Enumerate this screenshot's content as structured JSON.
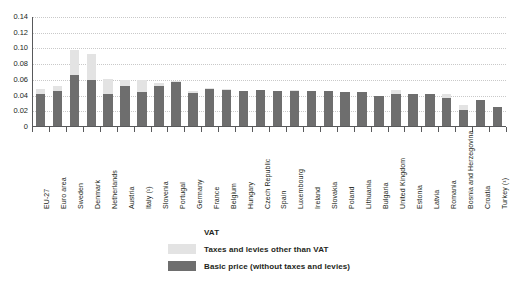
{
  "chart_data": {
    "type": "bar",
    "subtype": "stacked-bar",
    "title": "",
    "xlabel": "",
    "ylabel": "",
    "ylim": [
      0,
      0.14
    ],
    "yticks": [
      "0",
      "0.02",
      "0.04",
      "0.06",
      "0.08",
      "0.10",
      "0.12",
      "0.14"
    ],
    "ytick_values": [
      0,
      0.02,
      0.04,
      0.06,
      0.08,
      0.1,
      0.12,
      0.14
    ],
    "grid": true,
    "legend_position": "bottom",
    "categories": [
      "EU-27",
      "Euro area",
      "Sweden",
      "Denmark",
      "Netherlands",
      "Austria",
      "Italy (¹)",
      "Slovenia",
      "Portugal",
      "Germany",
      "France",
      "Belgium",
      "Hungary",
      "Czech Republic",
      "Spain",
      "Luxembourg",
      "Ireland",
      "Slovakia",
      "Poland",
      "Lithuania",
      "Bulgaria",
      "United Kingdom",
      "Estonia",
      "Latvia",
      "Romania",
      "Bosnia and Herzegovina",
      "Croatia",
      "Turkey (¹)"
    ],
    "series": [
      {
        "name": "Basic price (without taxes and levies)",
        "color": "#6e6e6e",
        "values": [
          0.0425,
          0.0455,
          0.0665,
          0.06,
          0.0415,
          0.052,
          0.045,
          0.0525,
          0.0575,
          0.0435,
          0.049,
          0.0475,
          0.0455,
          0.0465,
          0.046,
          0.0455,
          0.0455,
          0.0455,
          0.045,
          0.044,
          0.0395,
          0.042,
          0.0425,
          0.042,
          0.0375,
          0.0215,
          0.035,
          0.0255
        ]
      },
      {
        "name": "Taxes and levies other than VAT",
        "color": "#e3e3e3",
        "values": [
          0.0055,
          0.007,
          0.032,
          0.033,
          0.019,
          0.008,
          0.0145,
          0.004,
          0.001,
          0.002,
          0.001,
          0.0005,
          0.0005,
          0.0,
          0.0,
          0.001,
          0.0,
          0.0,
          0.0,
          0.0,
          0.0,
          0.005,
          0.0,
          0.0,
          0.004,
          0.0065,
          0.0,
          0.0
        ]
      },
      {
        "name": "VAT",
        "color": "#f4f4f4",
        "values": [
          0.0,
          0.0,
          0.0,
          0.0,
          0.0,
          0.0,
          0.0,
          0.0,
          0.0,
          0.0,
          0.0,
          0.0,
          0.0,
          0.0,
          0.0,
          0.0,
          0.0,
          0.0,
          0.0,
          0.0,
          0.0,
          0.0,
          0.0,
          0.0,
          0.0,
          0.0,
          0.0,
          0.0
        ]
      }
    ],
    "legend": [
      {
        "label": "VAT",
        "swatch": "white"
      },
      {
        "label": "Taxes and levies other than VAT",
        "swatch": "light-gray"
      },
      {
        "label": "Basic price (without taxes and levies)",
        "swatch": "dark-gray"
      }
    ],
    "colors": {
      "basic_price": "#6e6e6e",
      "other_taxes": "#e3e3e3",
      "vat": "#ffffff",
      "axis": "#58595b",
      "gridline": "#c9c9c9",
      "text": "#231f20",
      "background": "#ffffff"
    }
  }
}
